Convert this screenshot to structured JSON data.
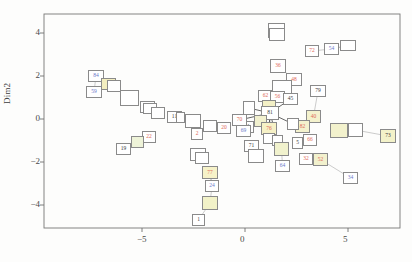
{
  "figure": {
    "type": "scatter",
    "xlabel": "",
    "ylabel": "Dim2",
    "panel": {
      "left": 44,
      "top": 14,
      "right": 400,
      "bottom": 228
    }
  },
  "axes": {
    "x_ticks": [
      {
        "value": -5,
        "label": "−5",
        "px": 142
      },
      {
        "value": 0,
        "label": "0",
        "px": 245
      },
      {
        "value": 5,
        "label": "5",
        "px": 348
      }
    ],
    "y_ticks": [
      {
        "value": 4,
        "label": "4",
        "px": 33
      },
      {
        "value": 2,
        "label": "2",
        "px": 76
      },
      {
        "value": 0,
        "label": "0",
        "px": 119
      },
      {
        "value": -2,
        "label": "−2",
        "px": 162
      },
      {
        "value": -4,
        "label": "−4",
        "px": 205
      }
    ]
  },
  "chart_data": {
    "type": "scatter",
    "title": "",
    "xlabel": "",
    "ylabel": "Dim2",
    "xlim": [
      -7.3,
      7.5
    ],
    "ylim": [
      -5.1,
      4.9
    ],
    "grid": false,
    "legend": null,
    "note": "Labelled boxes connected by thin leader lines; label colour encodes group (black/grey, red, blue, olive/yellow fills).",
    "colors": {
      "black": "#3b3b3b",
      "red": "#e06a5a",
      "blue": "#6b78c9",
      "olive_fill": "#f2f2d2",
      "yellow_fill": "#f5f0b8",
      "box_border": "#8a8a8a",
      "link": "#a9a9a9"
    },
    "points": [
      {
        "label": "84",
        "x": -5.15,
        "y": 2.0,
        "color": "blue",
        "fill": "#ffffff",
        "px": 88,
        "py": 70,
        "w": 16,
        "h": 12
      },
      {
        "label": "",
        "x": -4.55,
        "y": 1.62,
        "color": "black",
        "fill": "#f3eec0",
        "px": 101,
        "py": 78,
        "w": 15,
        "h": 12
      },
      {
        "label": "",
        "x": -4.35,
        "y": 1.55,
        "color": "black",
        "fill": "#ffffff",
        "px": 107,
        "py": 80,
        "w": 14,
        "h": 12
      },
      {
        "label": "59",
        "x": -5.25,
        "y": 1.35,
        "color": "blue",
        "fill": "#ffffff",
        "px": 86,
        "py": 86,
        "w": 16,
        "h": 12
      },
      {
        "label": "",
        "x": -3.85,
        "y": 1.2,
        "color": "black",
        "fill": "#ffffff",
        "px": 120,
        "py": 90,
        "w": 19,
        "h": 16
      },
      {
        "label": "89",
        "x": -3.1,
        "y": 0.62,
        "color": "black",
        "fill": "#ffffff",
        "px": 140,
        "py": 101,
        "w": 15,
        "h": 12
      },
      {
        "label": "",
        "x": -3.0,
        "y": 0.55,
        "color": "black",
        "fill": "#ffffff",
        "px": 143,
        "py": 103,
        "w": 14,
        "h": 11
      },
      {
        "label": "",
        "x": -2.7,
        "y": 0.38,
        "color": "black",
        "fill": "#ffffff",
        "px": 151,
        "py": 107,
        "w": 14,
        "h": 12
      },
      {
        "label": "11",
        "x": -2.05,
        "y": 0.2,
        "color": "black",
        "fill": "#ffffff",
        "px": 167,
        "py": 111,
        "w": 15,
        "h": 12
      },
      {
        "label": "",
        "x": -1.8,
        "y": 0.15,
        "color": "red",
        "fill": "#ffffff",
        "px": 176,
        "py": 112,
        "w": 9,
        "h": 11
      },
      {
        "label": "",
        "x": -1.45,
        "y": 0.05,
        "color": "black",
        "fill": "#ffffff",
        "px": 185,
        "py": 114,
        "w": 16,
        "h": 14
      },
      {
        "label": "",
        "x": -0.85,
        "y": -0.22,
        "color": "black",
        "fill": "#ffffff",
        "px": 203,
        "py": 120,
        "w": 14,
        "h": 12
      },
      {
        "label": "20",
        "x": -0.35,
        "y": -0.3,
        "color": "red",
        "fill": "#ffffff",
        "px": 217,
        "py": 122,
        "w": 14,
        "h": 12
      },
      {
        "label": "21",
        "x": 0.4,
        "y": -0.28,
        "color": "black",
        "fill": "#ffffff",
        "px": 240,
        "py": 121,
        "w": 14,
        "h": 12
      },
      {
        "label": "2",
        "x": -1.25,
        "y": -0.6,
        "color": "red",
        "fill": "#ffffff",
        "px": 191,
        "py": 128,
        "w": 12,
        "h": 12
      },
      {
        "label": "22",
        "x": -3.05,
        "y": -0.72,
        "color": "red",
        "fill": "#ffffff",
        "px": 142,
        "py": 131,
        "w": 14,
        "h": 12
      },
      {
        "label": "",
        "x": -3.45,
        "y": -0.95,
        "color": "black",
        "fill": "#eef3d8",
        "px": 131,
        "py": 136,
        "w": 13,
        "h": 12
      },
      {
        "label": "19",
        "x": -4.05,
        "y": -1.3,
        "color": "black",
        "fill": "#ffffff",
        "px": 116,
        "py": 143,
        "w": 15,
        "h": 12
      },
      {
        "label": "",
        "x": -1.3,
        "y": -1.5,
        "color": "black",
        "fill": "#ffffff",
        "px": 190,
        "py": 148,
        "w": 16,
        "h": 13
      },
      {
        "label": "",
        "x": -1.15,
        "y": -1.7,
        "color": "black",
        "fill": "#ffffff",
        "px": 195,
        "py": 152,
        "w": 14,
        "h": 12
      },
      {
        "label": "77",
        "x": -0.8,
        "y": -2.3,
        "color": "red",
        "fill": "#f6f2c8",
        "px": 202,
        "py": 166,
        "w": 16,
        "h": 13
      },
      {
        "label": "24",
        "x": -0.75,
        "y": -2.95,
        "color": "blue",
        "fill": "#ffffff",
        "px": 205,
        "py": 180,
        "w": 14,
        "h": 12
      },
      {
        "label": "",
        "x": -0.7,
        "y": -3.7,
        "color": "black",
        "fill": "#f2f2c8",
        "px": 202,
        "py": 196,
        "w": 16,
        "h": 14
      },
      {
        "label": "1",
        "x": -0.65,
        "y": -4.5,
        "color": "black",
        "fill": "#ffffff",
        "px": 192,
        "py": 214,
        "w": 13,
        "h": 12
      },
      {
        "label": "",
        "x": 1.45,
        "y": 4.25,
        "color": "black",
        "fill": "#ffffff",
        "px": 268,
        "py": 23,
        "w": 17,
        "h": 15
      },
      {
        "label": "",
        "x": 1.45,
        "y": 4.05,
        "color": "black",
        "fill": "#ffffff",
        "px": 269,
        "py": 28,
        "w": 16,
        "h": 13
      },
      {
        "label": "36",
        "x": 1.48,
        "y": 2.55,
        "color": "red",
        "fill": "#ffffff",
        "px": 270,
        "py": 59,
        "w": 16,
        "h": 14
      },
      {
        "label": "72",
        "x": 2.55,
        "y": 3.05,
        "color": "red",
        "fill": "#ffffff",
        "px": 305,
        "py": 45,
        "w": 14,
        "h": 12
      },
      {
        "label": "54",
        "x": 3.3,
        "y": 2.72,
        "color": "blue",
        "fill": "#ffffff",
        "px": 324,
        "py": 43,
        "w": 15,
        "h": 12
      },
      {
        "label": "",
        "x": 3.75,
        "y": 2.72,
        "color": "black",
        "fill": "#ffffff",
        "px": 340,
        "py": 40,
        "w": 16,
        "h": 11
      },
      {
        "label": "48",
        "x": 2.05,
        "y": 1.78,
        "color": "red",
        "fill": "#ffffff",
        "px": 286,
        "py": 73,
        "w": 16,
        "h": 13
      },
      {
        "label": "",
        "x": 1.52,
        "y": 1.55,
        "color": "black",
        "fill": "#ffffff",
        "px": 272,
        "py": 80,
        "w": 20,
        "h": 17
      },
      {
        "label": "62",
        "x": 1.05,
        "y": 1.1,
        "color": "red",
        "fill": "#ffffff",
        "px": 258,
        "py": 90,
        "w": 15,
        "h": 12
      },
      {
        "label": "56",
        "x": 1.45,
        "y": 1.05,
        "color": "red",
        "fill": "#ffffff",
        "px": 270,
        "py": 91,
        "w": 15,
        "h": 12
      },
      {
        "label": "45",
        "x": 1.9,
        "y": 0.95,
        "color": "black",
        "fill": "#ffffff",
        "px": 283,
        "py": 93,
        "w": 15,
        "h": 12
      },
      {
        "label": "79",
        "x": 2.7,
        "y": 1.35,
        "color": "black",
        "fill": "#ffffff",
        "px": 310,
        "py": 85,
        "w": 16,
        "h": 12
      },
      {
        "label": "",
        "x": 0.55,
        "y": 0.62,
        "color": "black",
        "fill": "#ffffff",
        "px": 243,
        "py": 101,
        "w": 12,
        "h": 14
      },
      {
        "label": "",
        "x": 1.22,
        "y": 0.62,
        "color": "red",
        "fill": "#f3f0c6",
        "px": 262,
        "py": 100,
        "w": 14,
        "h": 10
      },
      {
        "label": "81",
        "x": 1.25,
        "y": 0.38,
        "color": "black",
        "fill": "#ffffff",
        "px": 261,
        "py": 106,
        "w": 18,
        "h": 14
      },
      {
        "label": "70",
        "x": 0.18,
        "y": 0.08,
        "color": "red",
        "fill": "#ffffff",
        "px": 232,
        "py": 114,
        "w": 15,
        "h": 12
      },
      {
        "label": "",
        "x": 0.95,
        "y": 0.05,
        "color": "black",
        "fill": "#f2f1cf",
        "px": 254,
        "py": 115,
        "w": 13,
        "h": 12
      },
      {
        "label": "40",
        "x": 2.6,
        "y": 0.22,
        "color": "red",
        "fill": "#f4f2cd",
        "px": 306,
        "py": 110,
        "w": 15,
        "h": 13
      },
      {
        "label": "82",
        "x": 2.25,
        "y": -0.22,
        "color": "red",
        "fill": "#f4f2cd",
        "px": 295,
        "py": 120,
        "w": 15,
        "h": 13
      },
      {
        "label": "",
        "x": 2.0,
        "y": -0.18,
        "color": "black",
        "fill": "#ffffff",
        "px": 287,
        "py": 118,
        "w": 12,
        "h": 12
      },
      {
        "label": "76",
        "x": 1.2,
        "y": -0.3,
        "color": "red",
        "fill": "#f6f1c6",
        "px": 261,
        "py": 122,
        "w": 16,
        "h": 13
      },
      {
        "label": "69",
        "x": 0.3,
        "y": -0.45,
        "color": "blue",
        "fill": "#ffffff",
        "px": 236,
        "py": 125,
        "w": 15,
        "h": 12
      },
      {
        "label": "",
        "x": 3.45,
        "y": -0.35,
        "color": "black",
        "fill": "#f3f2cd",
        "px": 330,
        "py": 123,
        "w": 18,
        "h": 15
      },
      {
        "label": "",
        "x": 3.95,
        "y": -0.35,
        "color": "black",
        "fill": "#ffffff",
        "px": 348,
        "py": 123,
        "w": 15,
        "h": 14
      },
      {
        "label": "73",
        "x": 5.1,
        "y": -0.62,
        "color": "black",
        "fill": "#f3f2c9",
        "px": 380,
        "py": 129,
        "w": 16,
        "h": 14
      },
      {
        "label": "",
        "x": 1.3,
        "y": -0.85,
        "color": "black",
        "fill": "#ffffff",
        "px": 263,
        "py": 133,
        "w": 12,
        "h": 11
      },
      {
        "label": "",
        "x": 1.55,
        "y": -0.95,
        "color": "red",
        "fill": "#ffffff",
        "px": 272,
        "py": 135,
        "w": 11,
        "h": 11
      },
      {
        "label": "71",
        "x": 0.55,
        "y": -1.15,
        "color": "black",
        "fill": "#ffffff",
        "px": 244,
        "py": 140,
        "w": 15,
        "h": 12
      },
      {
        "label": "",
        "x": 0.7,
        "y": -1.55,
        "color": "black",
        "fill": "#ffffff",
        "px": 248,
        "py": 149,
        "w": 16,
        "h": 14
      },
      {
        "label": "",
        "x": 1.62,
        "y": -1.25,
        "color": "black",
        "fill": "#f1f2cd",
        "px": 274,
        "py": 142,
        "w": 15,
        "h": 14
      },
      {
        "label": "5",
        "x": 2.25,
        "y": -1.05,
        "color": "black",
        "fill": "#ffffff",
        "px": 292,
        "py": 137,
        "w": 11,
        "h": 12
      },
      {
        "label": "66",
        "x": 2.6,
        "y": -0.92,
        "color": "red",
        "fill": "#ffffff",
        "px": 303,
        "py": 134,
        "w": 14,
        "h": 12
      },
      {
        "label": "32",
        "x": 2.5,
        "y": -1.7,
        "color": "red",
        "fill": "#ffffff",
        "px": 299,
        "py": 153,
        "w": 14,
        "h": 12
      },
      {
        "label": "52",
        "x": 2.95,
        "y": -1.7,
        "color": "red",
        "fill": "#f2f1cd",
        "px": 313,
        "py": 153,
        "w": 15,
        "h": 13
      },
      {
        "label": "64",
        "x": 1.65,
        "y": -2.0,
        "color": "blue",
        "fill": "#ffffff",
        "px": 275,
        "py": 160,
        "w": 15,
        "h": 12
      },
      {
        "label": "34",
        "x": 3.85,
        "y": -2.55,
        "color": "blue",
        "fill": "#ffffff",
        "px": 343,
        "py": 172,
        "w": 15,
        "h": 12
      }
    ],
    "links": [
      [
        96,
        76
      ],
      [
        109,
        84
      ],
      [
        94,
        90
      ],
      [
        113,
        86
      ],
      [
        128,
        96
      ],
      [
        147,
        104
      ],
      [
        157,
        111
      ],
      [
        174,
        116
      ],
      [
        182,
        117
      ],
      [
        193,
        120
      ],
      [
        210,
        125
      ],
      [
        224,
        127
      ],
      [
        247,
        126
      ],
      [
        197,
        133
      ],
      [
        149,
        136
      ],
      [
        137,
        141
      ],
      [
        124,
        147
      ],
      [
        198,
        154
      ],
      [
        201,
        160
      ],
      [
        210,
        172
      ],
      [
        212,
        186
      ],
      [
        210,
        202
      ],
      [
        199,
        208
      ],
      [
        276,
        31
      ],
      [
        277,
        38
      ],
      [
        278,
        66
      ],
      [
        278,
        73
      ],
      [
        312,
        51
      ],
      [
        318,
        49
      ],
      [
        331,
        46
      ],
      [
        348,
        45
      ],
      [
        294,
        79
      ],
      [
        282,
        88
      ],
      [
        266,
        96
      ],
      [
        276,
        97
      ],
      [
        290,
        99
      ],
      [
        318,
        91
      ],
      [
        249,
        108
      ],
      [
        269,
        105
      ],
      [
        270,
        112
      ],
      [
        240,
        120
      ],
      [
        261,
        121
      ],
      [
        313,
        116
      ],
      [
        302,
        126
      ],
      [
        293,
        124
      ],
      [
        269,
        128
      ],
      [
        243,
        131
      ],
      [
        339,
        130
      ],
      [
        356,
        130
      ],
      [
        372,
        132
      ],
      [
        269,
        139
      ],
      [
        278,
        141
      ],
      [
        251,
        146
      ],
      [
        256,
        156
      ],
      [
        281,
        148
      ],
      [
        298,
        143
      ],
      [
        310,
        140
      ],
      [
        306,
        159
      ],
      [
        320,
        159
      ],
      [
        282,
        166
      ],
      [
        336,
        178
      ]
    ]
  }
}
